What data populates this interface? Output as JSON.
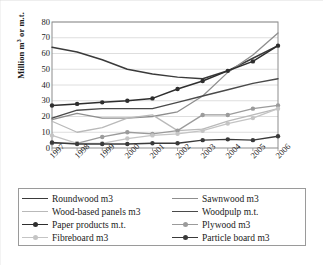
{
  "chart_data": {
    "type": "line",
    "title": "",
    "xlabel": "",
    "ylabel": "Million m3 or m.t.",
    "ylabel_prefix": "Million m",
    "ylabel_sup": "3",
    "ylabel_suffix": " or m.t.",
    "categories": [
      "1997",
      "1998",
      "1999",
      "2000",
      "2001",
      "2002",
      "2003",
      "2004",
      "2005",
      "2006"
    ],
    "x": [
      1997,
      1998,
      1999,
      2000,
      2001,
      2002,
      2003,
      2004,
      2005,
      2006
    ],
    "ylim": [
      0,
      80
    ],
    "yticks": [
      0,
      10,
      20,
      30,
      40,
      50,
      60,
      70,
      80
    ],
    "ytick_labels": [
      "0",
      "10",
      "20",
      "30",
      "40",
      "50",
      "60",
      "70",
      "80"
    ],
    "grid": "horizontal",
    "legend_position": "bottom",
    "legend_columns": 2,
    "series": [
      {
        "name": "Roundwood m3",
        "color": "#3a3a3a",
        "marker": "none",
        "width": 1.5,
        "values": [
          64,
          61,
          56,
          50,
          47,
          45,
          44,
          49,
          57,
          65
        ]
      },
      {
        "name": "Sawnwood m3",
        "color": "#8e8e8e",
        "marker": "none",
        "width": 1.3,
        "values": [
          18,
          22,
          19,
          19,
          20,
          23,
          33,
          48,
          59,
          73
        ]
      },
      {
        "name": "Wood-based panels m3",
        "color": "#b9b9b9",
        "marker": "none",
        "width": 1.3,
        "values": [
          17,
          10,
          13,
          19,
          21,
          11,
          12,
          17,
          21,
          25
        ]
      },
      {
        "name": "Woodpulp m.t.",
        "color": "#4a4a4a",
        "marker": "none",
        "width": 1.4,
        "values": [
          19,
          24,
          25,
          25,
          25,
          29,
          33,
          37,
          41,
          44
        ]
      },
      {
        "name": "Paper products m.t.",
        "color": "#2e2e2e",
        "marker": "circle",
        "width": 1.5,
        "values": [
          27,
          28,
          29,
          30,
          31.5,
          37.5,
          42.5,
          49,
          55,
          65
        ]
      },
      {
        "name": "Plywood m3",
        "color": "#9b9b9b",
        "marker": "circle",
        "width": 1.3,
        "values": [
          3,
          3,
          7,
          10,
          9,
          11,
          21,
          21,
          25,
          27
        ]
      },
      {
        "name": "Fibreboard m3",
        "color": "#c4c4c4",
        "marker": "circle",
        "width": 1.3,
        "values": [
          8,
          3,
          3,
          6,
          8,
          9,
          11,
          15.5,
          19,
          25
        ]
      },
      {
        "name": "Particle board m3",
        "color": "#3a3a3a",
        "marker": "circle",
        "width": 1.4,
        "values": [
          3.5,
          2.5,
          2.5,
          2.5,
          3,
          3,
          5,
          5.5,
          5,
          7.5
        ]
      }
    ]
  },
  "legend": {
    "entries": [
      {
        "label": "Roundwood m3",
        "series_index": 0
      },
      {
        "label": "Sawnwood m3",
        "series_index": 1
      },
      {
        "label": "Wood-based panels m3",
        "series_index": 2
      },
      {
        "label": "Woodpulp m.t.",
        "series_index": 3
      },
      {
        "label": "Paper products m.t.",
        "series_index": 4
      },
      {
        "label": "Plywood m3",
        "series_index": 5
      },
      {
        "label": "Fibreboard m3",
        "series_index": 6
      },
      {
        "label": "Particle board m3",
        "series_index": 7
      }
    ]
  },
  "style": {
    "plot_border": "#8c8c8c",
    "gridline": "#d6d6d6",
    "legend_border": "#9a9a9a",
    "background": "#ffffff",
    "text": "#1a1a1a"
  }
}
